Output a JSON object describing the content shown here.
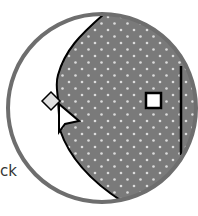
{
  "magnifier": {
    "partial_label": "ck",
    "lens_ring_color": "#6e6e6e",
    "shape_fill_color": "#7a7a7a",
    "dot_color": "#dcdcdc",
    "outline_color": "#000000",
    "handles": [
      {
        "type": "diamond",
        "name": "rotate-handle"
      },
      {
        "type": "square",
        "name": "resize-handle"
      }
    ],
    "cursor": "arrow-pointer"
  }
}
